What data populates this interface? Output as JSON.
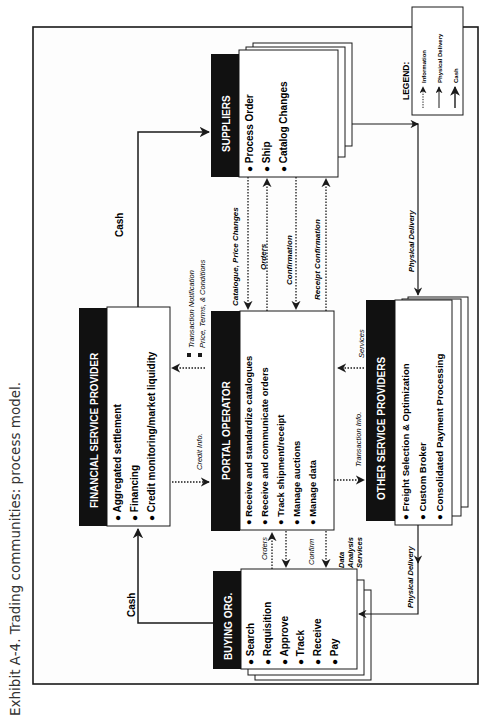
{
  "caption": "Exhibit A-4.  Trading communities: process model.",
  "legend": {
    "title": "LEGEND:",
    "items": [
      {
        "label": "Information",
        "style": "dotted"
      },
      {
        "label": "Physical Delivery",
        "style": "solid-thin"
      },
      {
        "label": "Cash",
        "style": "solid"
      }
    ]
  },
  "boxes": {
    "suppliers": {
      "title": "SUPPLIERS",
      "items": [
        "Process Order",
        "Ship",
        "Catalog Changes"
      ]
    },
    "financial": {
      "title": "FINANCIAL SERVICE PROVIDER",
      "items": [
        "Aggregated settlement",
        "Financing",
        "Credit monitoring/market liquidity"
      ]
    },
    "portal": {
      "title": "PORTAL OPERATOR",
      "items": [
        "Receive and standardize catalogues",
        "Receive and communicate orders",
        "Track shipment/receipt",
        "Manage auctions",
        "Manage data"
      ]
    },
    "other": {
      "title": "OTHER SERVICE PROVIDERS",
      "items": [
        "Freight Selection & Optimization",
        "Custom Broker",
        "Consolidated Payment Processing"
      ]
    },
    "buying": {
      "title": "BUYING ORG.",
      "items": [
        "Search",
        "Requisition",
        "Approve",
        "Track",
        "Receive",
        "Pay"
      ]
    }
  },
  "flows": {
    "cash_top": "Cash",
    "cash_bottom": "Cash",
    "catalogue": "Catalogue, Price Changes",
    "orders_supplier": "Orders",
    "confirmation": "Confirmation",
    "receipt_confirmation": "Receipt  Confirmation",
    "transaction_notification": "Transaction Notification",
    "price_terms": "Price, Terms, & Conditions",
    "credit_info": "Credit Info.",
    "transaction_info": "Transaction Info.",
    "services": "Services",
    "orders_buyer": "Orders",
    "confirm_buyer": "Confirm",
    "data_analysis_1": "Data",
    "data_analysis_2": "Analysis",
    "data_analysis_3": "Services",
    "physical_delivery_top": "Physical Delivery",
    "physical_delivery_bottom": "Physical Delivery"
  },
  "colors": {
    "ink": "#1a1a1a",
    "header_fill": "#111111",
    "box_fill": "#ffffff",
    "page": "#fdfdfd"
  }
}
